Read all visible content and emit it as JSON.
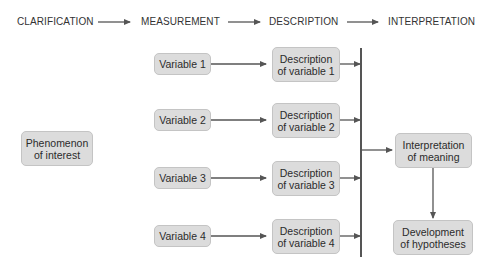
{
  "stages": [
    {
      "label": "CLARIFICATION"
    },
    {
      "label": "MEASUREMENT"
    },
    {
      "label": "DESCRIPTION"
    },
    {
      "label": "INTERPRETATION"
    }
  ],
  "phenomenon": {
    "label": "Phenomenon\nof interest"
  },
  "variables": [
    {
      "label": "Variable 1",
      "description": "Description\nof variable 1"
    },
    {
      "label": "Variable 2",
      "description": "Description\nof variable 2"
    },
    {
      "label": "Variable 3",
      "description": "Description\nof variable 3"
    },
    {
      "label": "Variable 4",
      "description": "Description\nof variable 4"
    }
  ],
  "interpretation": {
    "label": "Interpretation\nof meaning"
  },
  "hypotheses": {
    "label": "Development\nof hypotheses"
  },
  "colors": {
    "box_fill": "#dcdcdc",
    "box_border": "#c4c4c4",
    "line": "#555555"
  }
}
